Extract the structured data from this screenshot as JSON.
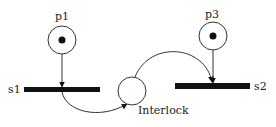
{
  "diagram": {
    "type": "petri-net",
    "places": [
      {
        "id": "p1",
        "label": "p1",
        "tokens": 1
      },
      {
        "id": "p3",
        "label": "p3",
        "tokens": 1
      },
      {
        "id": "interlock",
        "label": "Interlock",
        "tokens": 0
      }
    ],
    "transitions": [
      {
        "id": "s1",
        "label": "s1"
      },
      {
        "id": "s2",
        "label": "s2"
      }
    ],
    "arcs": [
      {
        "from": "p1",
        "to": "s1"
      },
      {
        "from": "s1",
        "to": "interlock"
      },
      {
        "from": "interlock",
        "to": "s2"
      },
      {
        "from": "p3",
        "to": "s2"
      }
    ]
  }
}
